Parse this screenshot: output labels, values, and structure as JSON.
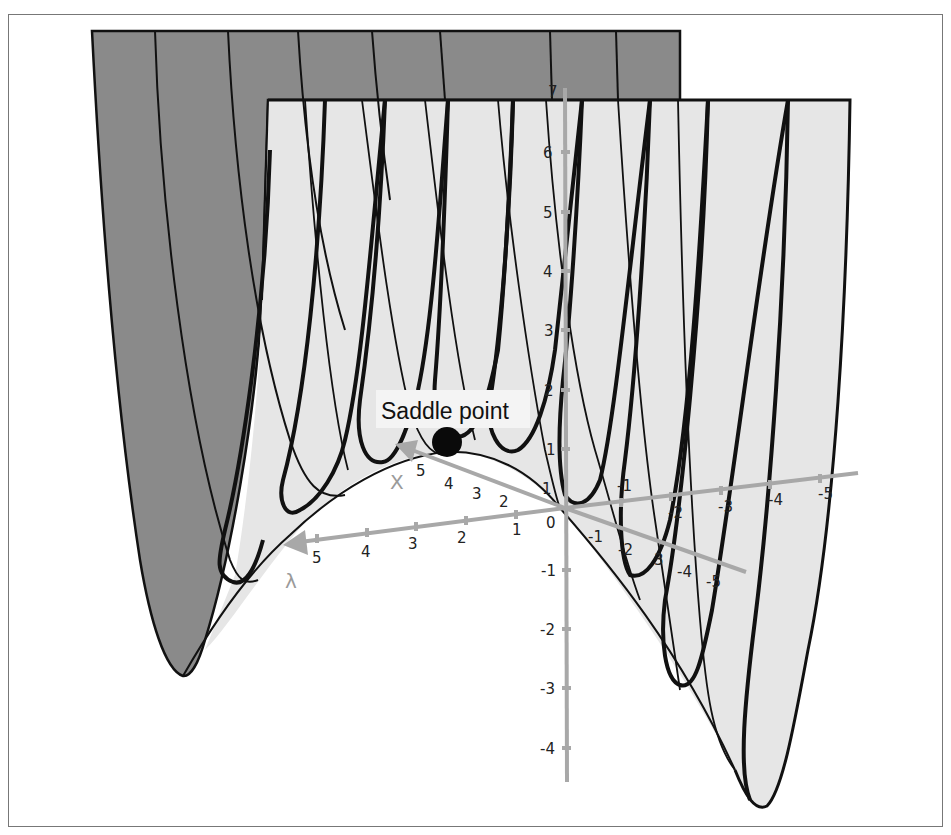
{
  "figure": {
    "type": "3d-surface-diagram",
    "annotation": {
      "label": "Saddle point"
    },
    "axes": {
      "vertical": {
        "ticks": [
          "7",
          "6",
          "5",
          "4",
          "3",
          "2",
          "1",
          "-1",
          "-2",
          "-3",
          "-4"
        ]
      },
      "x": {
        "name": "X",
        "positive_ticks": [
          "5",
          "4",
          "3",
          "2",
          "1"
        ],
        "negative_ticks": [
          "-1",
          "-2",
          "-3",
          "-4",
          "-5"
        ]
      },
      "lambda": {
        "name": "λ",
        "positive_ticks": [
          "5",
          "4",
          "3",
          "2",
          "1"
        ],
        "negative_ticks": [
          "-1",
          "-2",
          "3",
          "-4",
          "-5"
        ]
      },
      "origin_label": "0"
    },
    "colors": {
      "back_panel": "#8a8a8a",
      "front_panel": "#e6e6e6",
      "axis": "#a8a8a8",
      "curve": "#111111",
      "background": "#ffffff"
    }
  }
}
